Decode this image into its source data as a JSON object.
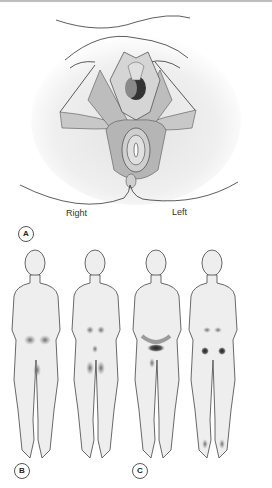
{
  "figure": {
    "panel_a": {
      "label": "A",
      "side_labels": {
        "right": "Right",
        "left": "Left"
      },
      "description": "Perineal anatomy illustration with superficial muscles"
    },
    "panel_b": {
      "label": "B",
      "views": [
        "front",
        "back"
      ],
      "description": "Body pain referral pattern: lower abdomen/groin, inner thighs, sacral and buttock areas"
    },
    "panel_c": {
      "label": "C",
      "views": [
        "front",
        "back"
      ],
      "description": "Body pain referral pattern: suprapubic band, pubic region, lumbar, buttock points and heels"
    }
  }
}
